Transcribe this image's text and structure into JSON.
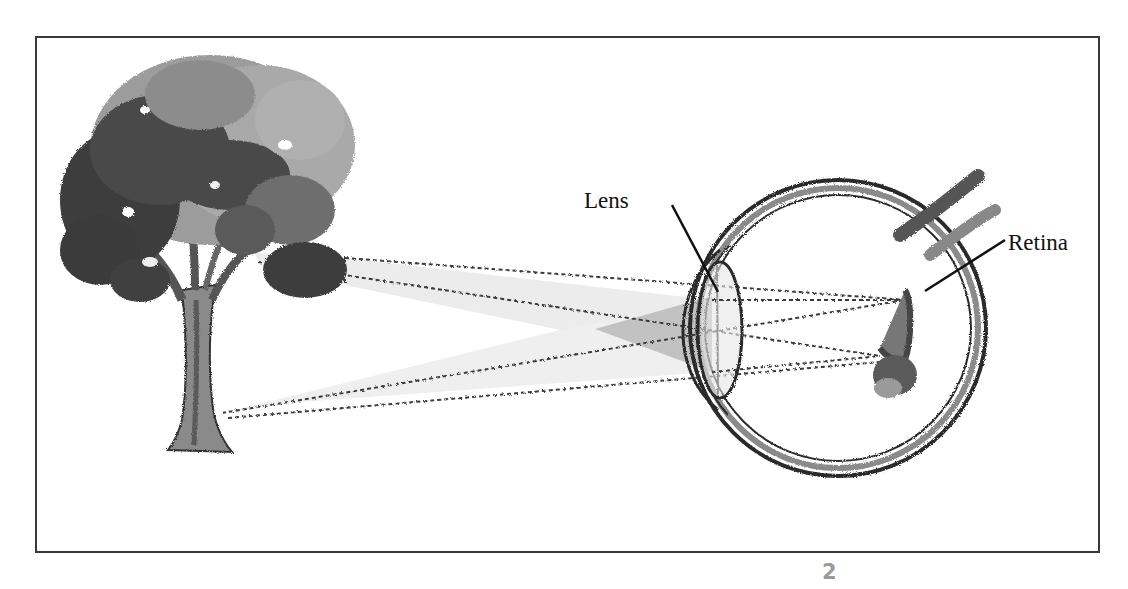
{
  "figure": {
    "labels": {
      "lens": "Lens",
      "retina": "Retina"
    },
    "page_number": "2"
  },
  "colors": {
    "frame": "#3a3a3a",
    "outline": "#2b2b2b",
    "ray_fill_light": "#ececec",
    "ray_fill_dark": "#bdbdbd",
    "tree_dark": "#3c3c3c",
    "tree_mid": "#7a7a7a",
    "tree_light": "#a8a8a8",
    "page_number": "#9a9a9a"
  }
}
